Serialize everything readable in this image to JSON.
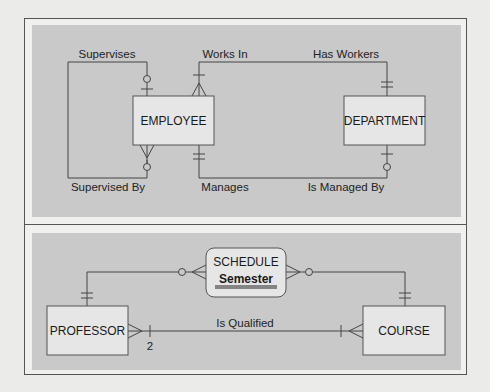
{
  "diagram_top": {
    "entities": {
      "employee": "EMPLOYEE",
      "department": "DEPARTMENT"
    },
    "relationships": {
      "supervises": "Supervises",
      "supervised_by": "Supervised By",
      "works_in": "Works In",
      "has_workers": "Has Workers",
      "manages": "Manages",
      "is_managed_by": "Is Managed By"
    }
  },
  "diagram_bottom": {
    "associative_entity": {
      "name": "SCHEDULE",
      "attribute": "Semester"
    },
    "entities": {
      "professor": "PROFESSOR",
      "course": "COURSE"
    },
    "relationships": {
      "is_qualified": "Is Qualified",
      "cardinality_label": "2"
    }
  },
  "colors": {
    "panel": "#c9c9c9",
    "entity_fill": "#e6e6e6",
    "line": "#444444",
    "frame_bg": "#f0f0ef"
  }
}
